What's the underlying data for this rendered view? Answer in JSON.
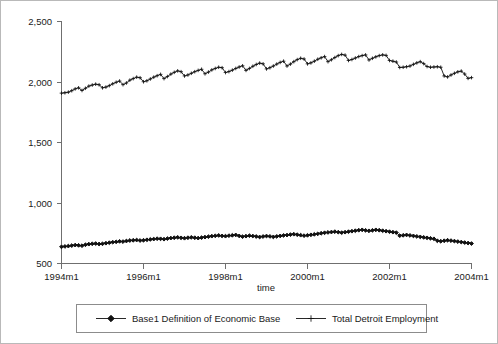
{
  "chart_data": {
    "type": "line",
    "title": "",
    "xlabel": "time",
    "ylabel": "",
    "grid": false,
    "legend_position": "bottom",
    "ylim": [
      500,
      2500
    ],
    "yticks": [
      500,
      1000,
      1500,
      2000,
      2500
    ],
    "ytick_labels": [
      "500",
      "1,000",
      "1,500",
      "2,000",
      "2,500"
    ],
    "xtick_labels": [
      "1994m1",
      "1996m1",
      "1998m1",
      "2000m1",
      "2002m1",
      "2004m1"
    ],
    "xticks": [
      1994,
      1996,
      1998,
      2000,
      2002,
      2004
    ],
    "xlim": [
      1994,
      2004
    ],
    "x_start": "1994m1",
    "x_end": "2004m1",
    "x_frequency": "monthly",
    "n_points": 121,
    "series": [
      {
        "name": "Base1 Definition of Economic Base",
        "marker": "diamond",
        "color": "#111111",
        "values": [
          638,
          641,
          644,
          648,
          652,
          650,
          647,
          655,
          660,
          663,
          665,
          661,
          663,
          668,
          672,
          676,
          679,
          683,
          681,
          686,
          690,
          692,
          694,
          690,
          692,
          696,
          699,
          702,
          705,
          704,
          701,
          706,
          710,
          713,
          716,
          712,
          709,
          713,
          716,
          713,
          710,
          714,
          718,
          722,
          726,
          729,
          732,
          728,
          726,
          730,
          733,
          736,
          728,
          722,
          726,
          730,
          727,
          723,
          719,
          723,
          727,
          724,
          720,
          724,
          728,
          732,
          735,
          739,
          742,
          738,
          734,
          730,
          733,
          737,
          741,
          745,
          750,
          754,
          757,
          760,
          763,
          759,
          755,
          759,
          763,
          767,
          771,
          775,
          778,
          774,
          770,
          774,
          778,
          775,
          771,
          767,
          763,
          759,
          755,
          730,
          733,
          736,
          732,
          728,
          724,
          720,
          716,
          712,
          708,
          704,
          688,
          684,
          688,
          692,
          689,
          685,
          681,
          677,
          673,
          669,
          665
        ]
      },
      {
        "name": "Total Detroit Employment",
        "marker": "plus",
        "color": "#111111",
        "values": [
          1908,
          1911,
          1916,
          1928,
          1943,
          1952,
          1930,
          1948,
          1966,
          1975,
          1982,
          1977,
          1952,
          1958,
          1970,
          1985,
          1998,
          2008,
          1978,
          1992,
          2015,
          2028,
          2040,
          2035,
          2002,
          2010,
          2025,
          2040,
          2052,
          2063,
          2028,
          2045,
          2065,
          2080,
          2092,
          2085,
          2050,
          2058,
          2072,
          2085,
          2096,
          2105,
          2068,
          2082,
          2100,
          2112,
          2122,
          2118,
          2078,
          2086,
          2098,
          2112,
          2124,
          2134,
          2096,
          2112,
          2130,
          2145,
          2156,
          2150,
          2108,
          2118,
          2132,
          2148,
          2162,
          2172,
          2132,
          2148,
          2168,
          2185,
          2196,
          2190,
          2150,
          2158,
          2172,
          2188,
          2200,
          2210,
          2168,
          2184,
          2202,
          2218,
          2228,
          2222,
          2178,
          2186,
          2198,
          2210,
          2218,
          2224,
          2182,
          2196,
          2208,
          2218,
          2224,
          2220,
          2178,
          2172,
          2165,
          2120,
          2122,
          2126,
          2132,
          2146,
          2158,
          2168,
          2152,
          2128,
          2122,
          2124,
          2126,
          2122,
          2050,
          2042,
          2058,
          2072,
          2084,
          2090,
          2066,
          2030,
          2036
        ]
      }
    ]
  },
  "axis": {
    "xlabel": "time",
    "ytick_labels": [
      "2,500",
      "2,000",
      "1,500",
      "1,000",
      "500"
    ],
    "xtick_labels": [
      "1994m1",
      "1996m1",
      "1998m1",
      "2000m1",
      "2002m1",
      "2004m1"
    ]
  },
  "legend": {
    "entries": [
      {
        "label": "Base1 Definition of Economic Base",
        "marker": "diamond"
      },
      {
        "label": "Total Detroit Employment",
        "marker": "plus"
      }
    ]
  }
}
